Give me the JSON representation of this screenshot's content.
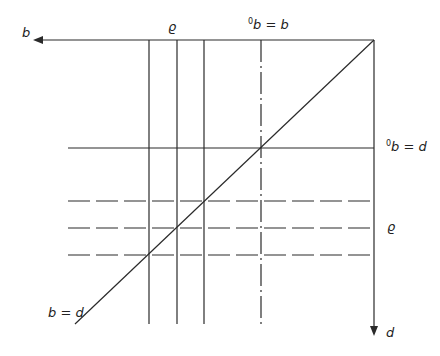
{
  "diagram": {
    "title": "",
    "stroke_color": "#2a2a2a",
    "background": "#ffffff",
    "axes": {
      "horizontal": {
        "label": "b",
        "direction": "left",
        "y": 40,
        "x_from": 374,
        "x_to": 33
      },
      "vertical": {
        "label": "d",
        "direction": "down",
        "x": 374,
        "y_from": 40,
        "y_to": 336
      }
    },
    "diagonal": {
      "label": "b = d",
      "x1": 374,
      "y1": 40,
      "x2": 75,
      "y2": 324
    },
    "vertical_lines": [
      {
        "x": 149,
        "style": "solid"
      },
      {
        "x": 177,
        "style": "solid"
      },
      {
        "x": 204,
        "style": "solid"
      },
      {
        "x": 261,
        "style": "dash-dot"
      }
    ],
    "vertical_lines_range": {
      "y_top": 40,
      "y_bottom": 324
    },
    "horizontal_lines": [
      {
        "y": 148,
        "style": "solid"
      },
      {
        "y": 201,
        "style": "dashed"
      },
      {
        "y": 228,
        "style": "dashed"
      },
      {
        "y": 255,
        "style": "dashed"
      }
    ],
    "horizontal_lines_range": {
      "x_left": 68,
      "x_right": 374
    },
    "labels": {
      "top_group": "ϱ",
      "top_eq_pre": "0",
      "top_eq": "b = b",
      "right_eq_pre": "0",
      "right_eq": "b = d",
      "right_group": "ϱ",
      "axis_b": "b",
      "axis_d": "d",
      "diagonal": "b = d"
    }
  }
}
